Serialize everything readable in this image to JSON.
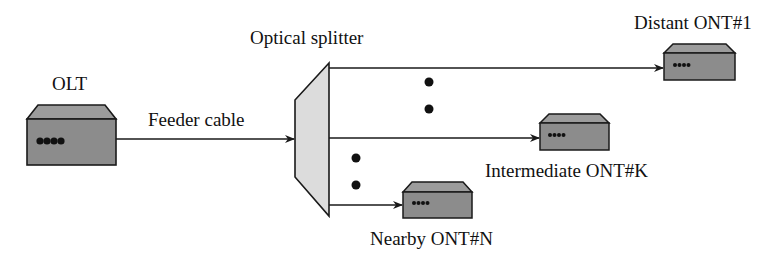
{
  "diagram": {
    "colors": {
      "device_body": "#8c8c8c",
      "device_top": "#9c9c9c",
      "splitter_fill": "#dcdcdc",
      "line": "#1a1a1a",
      "background": "#ffffff"
    },
    "nodes": {
      "olt": {
        "label": "OLT",
        "type": "device",
        "leds": 4
      },
      "splitter": {
        "label": "Optical splitter",
        "type": "splitter"
      },
      "ont_1": {
        "label": "Distant ONT#1",
        "type": "device",
        "leds": 4
      },
      "ont_k": {
        "label": "Intermediate ONT#K",
        "type": "device",
        "leds": 4
      },
      "ont_n": {
        "label": "Nearby ONT#N",
        "type": "device",
        "leds": 4
      }
    },
    "edges": [
      {
        "from": "olt",
        "to": "splitter",
        "label": "Feeder cable"
      },
      {
        "from": "splitter",
        "to": "ont_1",
        "label": ""
      },
      {
        "from": "splitter",
        "to": "ont_k",
        "label": ""
      },
      {
        "from": "splitter",
        "to": "ont_n",
        "label": ""
      }
    ],
    "ellipsis": [
      "between ONT#1 and ONT#K",
      "between ONT#K and ONT#N"
    ]
  }
}
